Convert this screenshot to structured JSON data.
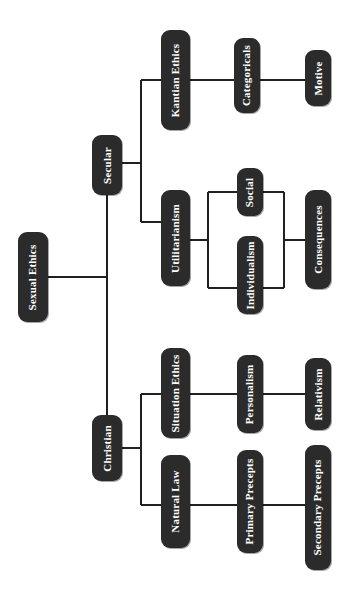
{
  "diagram": {
    "title": "Sexual Ethics",
    "type": "tree-mindmap",
    "orientation": "rotated-90-counterclockwise",
    "palette": {
      "node_fill": "#2b2b2b",
      "node_text": "#ffffff",
      "edge_color": "#231f20",
      "background": "#ffffff"
    },
    "nodes": [
      {
        "id": "sexual-ethics",
        "label": "Sexual Ethics",
        "x": 18,
        "y": 232,
        "w": 30,
        "h": 90,
        "level": 0
      },
      {
        "id": "secular",
        "label": "Secular",
        "x": 92,
        "y": 135,
        "w": 30,
        "h": 60,
        "level": 1
      },
      {
        "id": "christian",
        "label": "Christian",
        "x": 92,
        "y": 415,
        "w": 30,
        "h": 66,
        "level": 1
      },
      {
        "id": "kantian-ethics",
        "label": "Kantian Ethics",
        "x": 161,
        "y": 30,
        "w": 29,
        "h": 100,
        "level": 2
      },
      {
        "id": "utilitarianism",
        "label": "Utilitarianism",
        "x": 161,
        "y": 190,
        "w": 29,
        "h": 96,
        "level": 2
      },
      {
        "id": "situation-ethics",
        "label": "Situation Ethics",
        "x": 161,
        "y": 348,
        "w": 29,
        "h": 90,
        "level": 2
      },
      {
        "id": "natural-law",
        "label": "Natural Law",
        "x": 161,
        "y": 455,
        "w": 29,
        "h": 93,
        "level": 2
      },
      {
        "id": "categoricals",
        "label": "Categoricals",
        "x": 234,
        "y": 38,
        "w": 26,
        "h": 75,
        "level": 3
      },
      {
        "id": "social",
        "label": "Social",
        "x": 237,
        "y": 168,
        "w": 26,
        "h": 48,
        "level": 3
      },
      {
        "id": "individualism",
        "label": "Individualism",
        "x": 237,
        "y": 236,
        "w": 26,
        "h": 78,
        "level": 3
      },
      {
        "id": "personalism",
        "label": "Personalism",
        "x": 237,
        "y": 355,
        "w": 26,
        "h": 78,
        "level": 3
      },
      {
        "id": "primary-precepts",
        "label": "Primary Precepts",
        "x": 237,
        "y": 450,
        "w": 26,
        "h": 103,
        "level": 3
      },
      {
        "id": "motive",
        "label": "Motive",
        "x": 305,
        "y": 50,
        "w": 26,
        "h": 56,
        "level": 4
      },
      {
        "id": "consequences",
        "label": "Consequences",
        "x": 305,
        "y": 190,
        "w": 26,
        "h": 99,
        "level": 4
      },
      {
        "id": "relativism",
        "label": "Relativism",
        "x": 305,
        "y": 358,
        "w": 26,
        "h": 72,
        "level": 4
      },
      {
        "id": "secondary-precepts",
        "label": "Secondary Precepts",
        "x": 305,
        "y": 445,
        "w": 26,
        "h": 125,
        "level": 4
      }
    ],
    "edges": [
      {
        "id": "root-to-spine",
        "from": "sexual-ethics",
        "to": "spine"
      },
      {
        "id": "spine-to-secular",
        "from": "spine",
        "to": "secular"
      },
      {
        "id": "spine-to-christian",
        "from": "spine",
        "to": "christian"
      },
      {
        "id": "secular-to-kantian",
        "from": "secular",
        "to": "kantian-ethics"
      },
      {
        "id": "secular-to-utilitarianism",
        "from": "secular",
        "to": "utilitarianism"
      },
      {
        "id": "christian-to-situation",
        "from": "christian",
        "to": "situation-ethics"
      },
      {
        "id": "christian-to-natural-law",
        "from": "christian",
        "to": "natural-law"
      },
      {
        "id": "kantian-to-categoricals",
        "from": "kantian-ethics",
        "to": "categoricals"
      },
      {
        "id": "categoricals-to-motive",
        "from": "categoricals",
        "to": "motive"
      },
      {
        "id": "utilitarianism-to-social",
        "from": "utilitarianism",
        "to": "social"
      },
      {
        "id": "utilitarianism-to-individualism",
        "from": "utilitarianism",
        "to": "individualism"
      },
      {
        "id": "social-individualism-to-consequences",
        "from": "social+individualism",
        "to": "consequences"
      },
      {
        "id": "situation-to-personalism",
        "from": "situation-ethics",
        "to": "personalism"
      },
      {
        "id": "personalism-to-relativism",
        "from": "personalism",
        "to": "relativism"
      },
      {
        "id": "natural-law-to-primary",
        "from": "natural-law",
        "to": "primary-precepts"
      },
      {
        "id": "primary-to-secondary",
        "from": "primary-precepts",
        "to": "secondary-precepts"
      }
    ]
  }
}
